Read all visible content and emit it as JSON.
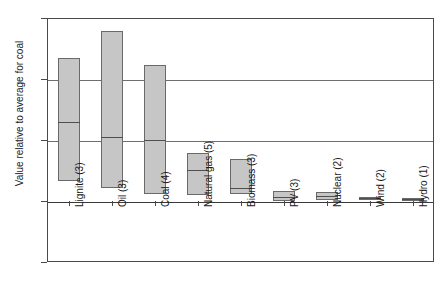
{
  "chart_data": {
    "type": "bar",
    "title": "",
    "subtitle": "",
    "xlabel": "",
    "ylabel": "Value relative to average for coal",
    "ylim": [
      -1,
      3
    ],
    "yticks": [
      3,
      2,
      1,
      0,
      -1
    ],
    "ytick_labels": [
      "3",
      "2",
      "1",
      "0",
      "-1"
    ],
    "grid": true,
    "legend": "none",
    "categories": [
      "Lignite (3)",
      "Oil (3)",
      "Coal (4)",
      "Natural gas (5)",
      "Biomass (3)",
      "PV (3)",
      "Nuclear (2)",
      "Wind (2)",
      "Hydro (1)"
    ],
    "series": [
      {
        "name": "Range low",
        "values": [
          0.32,
          0.21,
          0.11,
          0.1,
          0.11,
          0.0,
          0.02,
          0.02,
          0.02
        ]
      },
      {
        "name": "Central value",
        "values": [
          1.3,
          1.05,
          1.0,
          0.51,
          0.21,
          0.06,
          0.08,
          0.05,
          0.03
        ]
      },
      {
        "name": "Range high",
        "values": [
          2.35,
          2.78,
          2.23,
          0.79,
          0.69,
          0.17,
          0.15,
          0.07,
          0.05
        ]
      }
    ],
    "boxes": [
      {
        "label": "Lignite (3)",
        "count": 3,
        "low": 0.32,
        "mid": 1.3,
        "high": 2.35
      },
      {
        "label": "Oil (3)",
        "count": 3,
        "low": 0.21,
        "mid": 1.05,
        "high": 2.78
      },
      {
        "label": "Coal (4)",
        "count": 4,
        "low": 0.11,
        "mid": 1.0,
        "high": 2.23
      },
      {
        "label": "Natural gas (5)",
        "count": 5,
        "low": 0.1,
        "mid": 0.51,
        "high": 0.79
      },
      {
        "label": "Biomass (3)",
        "count": 3,
        "low": 0.11,
        "mid": 0.21,
        "high": 0.69
      },
      {
        "label": "PV (3)",
        "count": 3,
        "low": 0.0,
        "mid": 0.06,
        "high": 0.17
      },
      {
        "label": "Nuclear (2)",
        "count": 2,
        "low": 0.02,
        "mid": 0.08,
        "high": 0.15
      },
      {
        "label": "Wind (2)",
        "count": 2,
        "low": 0.02,
        "mid": 0.05,
        "high": 0.07
      },
      {
        "label": "Hydro (1)",
        "count": 1,
        "low": 0.02,
        "mid": 0.03,
        "high": 0.05
      }
    ],
    "colors": {
      "box_fill": "#c6c6c6",
      "box_border": "#6a6a6a",
      "median_line": "#4f4f4f",
      "gridline": "#6e6e6e",
      "frame": "#4a4a4a",
      "background": "#ffffff",
      "text": "#1a1a1a"
    }
  }
}
